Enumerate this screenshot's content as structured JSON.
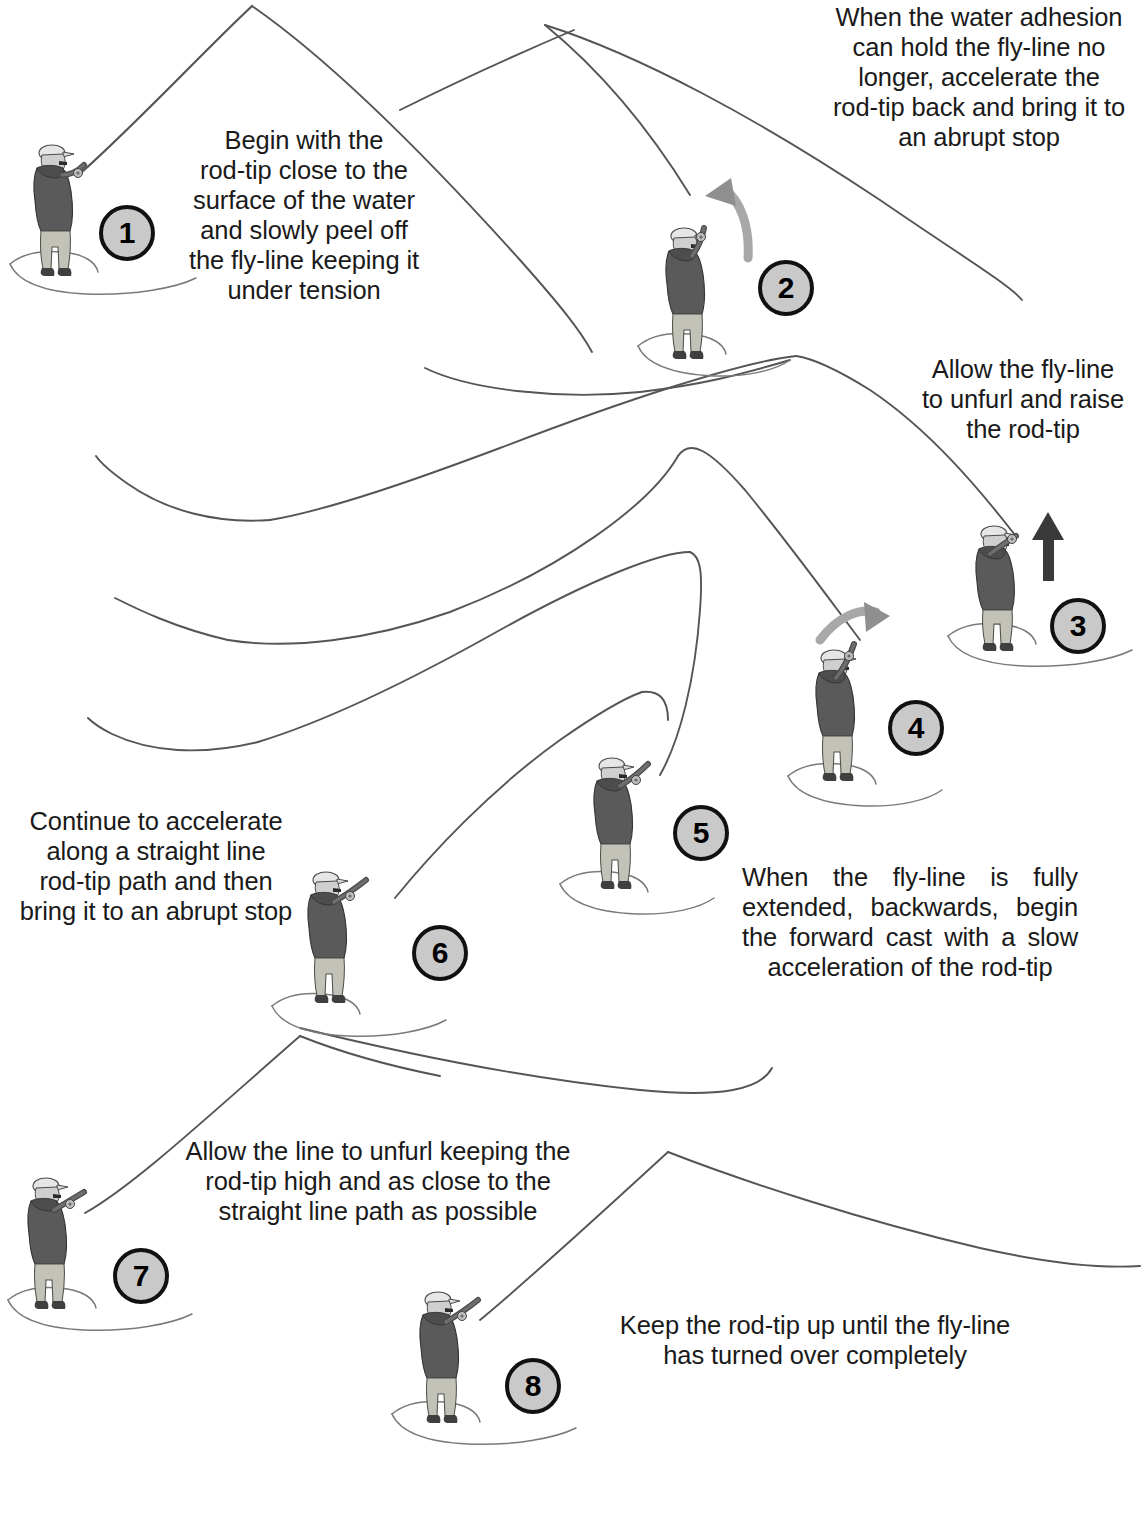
{
  "document": {
    "title": "Fly Casting Sequence",
    "background_color": "#ffffff",
    "text_color": "#1a1a1a",
    "line_color": "#555555",
    "badge_fill": "#c9c9c9",
    "badge_border": "#111111",
    "arrow_gray": "#9a9a9a",
    "arrow_dark": "#3a3a3a"
  },
  "steps": [
    {
      "number": "1",
      "caption": "Begin with the\nrod-tip close to the\nsurface of the water\nand slowly peel off\nthe fly-line keeping it\nunder tension",
      "caption_align": "center"
    },
    {
      "number": "2",
      "caption": "When the water adhesion\ncan hold the fly-line no\nlonger, accelerate the\nrod-tip back and bring it to\nan abrupt stop",
      "caption_align": "center"
    },
    {
      "number": "3",
      "caption": "Allow the fly-line\nto unfurl and raise\nthe rod-tip",
      "caption_align": "center"
    },
    {
      "number": "4",
      "caption": "",
      "caption_align": "center"
    },
    {
      "number": "5",
      "caption": "When the fly-line is fully extended, backwards, begin the forward cast with a slow acceleration of the rod-tip",
      "caption_align": "justify"
    },
    {
      "number": "6",
      "caption": "Continue to accelerate\nalong a straight line\nrod-tip path and then\nbring it to an abrupt stop",
      "caption_align": "center"
    },
    {
      "number": "7",
      "caption": "Allow the line to unfurl keeping the\nrod-tip high and as close to the\nstraight line path as possible",
      "caption_align": "center"
    },
    {
      "number": "8",
      "caption": "Keep the rod-tip up until the fly-line\nhas turned over completely",
      "caption_align": "center"
    }
  ],
  "arrows": [
    {
      "name": "backcast-arrow",
      "step": "2",
      "direction": "up-left",
      "style": "curved-gray"
    },
    {
      "name": "raise-rod-tip-arrow",
      "step": "3",
      "direction": "up",
      "style": "straight-dark"
    },
    {
      "name": "forward-cast-arrow",
      "step": "4",
      "direction": "right",
      "style": "curved-gray"
    }
  ],
  "figure_labels": {
    "angler": "fly-angler-wading",
    "flyline": "fly-line-path",
    "ripple": "water-ripple"
  }
}
